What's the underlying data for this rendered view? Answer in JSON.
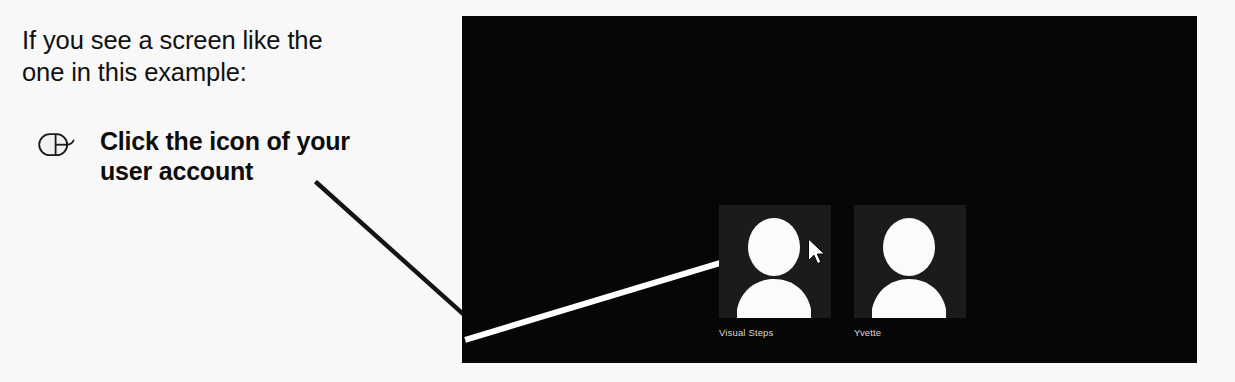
{
  "figure": {
    "kind": "instructional-callout",
    "background_color": "#f8f8f8"
  },
  "intro": {
    "line1": "If you see a screen like the",
    "line2": "one in this example:"
  },
  "instruction": {
    "icon": "mouse-click-icon",
    "line1": "Click the icon of your",
    "line2": "user account"
  },
  "leader_line": {
    "outside_color": "#111111",
    "inside_color": "#ffffff"
  },
  "screen": {
    "background_color": "#050505",
    "tile_color": "#1b1b1b",
    "label_color": "#d8d8d8",
    "accounts": [
      {
        "name": "Visual Steps",
        "avatar": "person-silhouette-icon",
        "has_cursor": true,
        "cursor_icon": "mouse-pointer-icon"
      },
      {
        "name": "Yvette",
        "avatar": "person-silhouette-icon",
        "has_cursor": false
      }
    ]
  }
}
